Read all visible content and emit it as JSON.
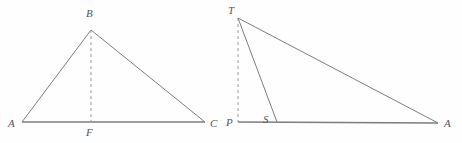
{
  "figure": {
    "background_color": "#fefefe",
    "stroke_color": "#7d7d7d",
    "dashed_stroke_color": "#9a9a9a",
    "label_color": "#555555",
    "width": 462,
    "height": 143
  },
  "diagrams": [
    {
      "id": "left-triangle",
      "name": "triangle-ABC-with-altitude-BF",
      "vertices": [
        {
          "label": "A",
          "x": 22,
          "y": 122,
          "label_x": 8,
          "label_y": 118
        },
        {
          "label": "B",
          "x": 91,
          "y": 30,
          "label_x": 86,
          "label_y": 8
        },
        {
          "label": "C",
          "x": 205,
          "y": 122,
          "label_x": 210,
          "label_y": 118
        }
      ],
      "foot": {
        "label": "F",
        "x": 91,
        "y": 122,
        "label_x": 86,
        "label_y": 127
      },
      "solid_edges": [
        {
          "name": "edge-AB",
          "from": "A",
          "to": "B"
        },
        {
          "name": "edge-BC",
          "from": "B",
          "to": "C"
        },
        {
          "name": "edge-AC",
          "from": "A",
          "to": "C"
        }
      ],
      "dashed_edges": [
        {
          "name": "altitude-BF",
          "from": "B",
          "to": "F"
        }
      ]
    },
    {
      "id": "right-triangle",
      "name": "triangle-TPA-with-cevian-TS",
      "vertices": [
        {
          "label": "T",
          "x": 238,
          "y": 18,
          "label_x": 228,
          "label_y": 5
        },
        {
          "label": "P",
          "x": 238,
          "y": 122,
          "label_x": 226,
          "label_y": 117
        },
        {
          "label": "A",
          "x": 438,
          "y": 123,
          "label_x": 444,
          "label_y": 118
        }
      ],
      "foot": {
        "label": "S",
        "x": 277,
        "y": 122,
        "label_x": 263,
        "label_y": 114
      },
      "solid_edges": [
        {
          "name": "edge-TA",
          "from": "T",
          "to": "A"
        },
        {
          "name": "edge-PA",
          "from": "P",
          "to": "A"
        },
        {
          "name": "cevian-TS",
          "from": "T",
          "to": "S"
        }
      ],
      "dashed_edges": [
        {
          "name": "segment-TP",
          "from": "T",
          "to": "P"
        }
      ]
    }
  ]
}
